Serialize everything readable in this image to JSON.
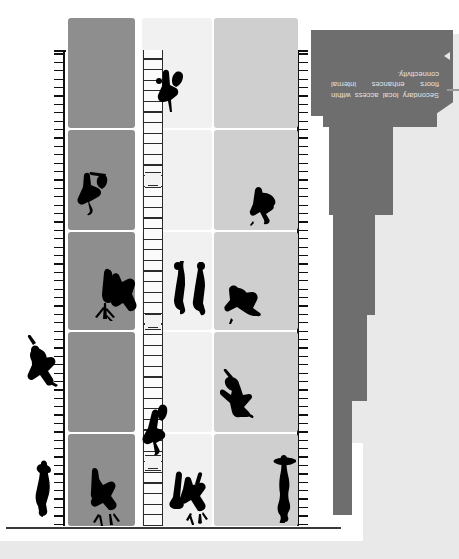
{
  "drawing": {
    "type": "architectural-floor-plan",
    "orientation_deg": 180,
    "canvas": {
      "width": 459,
      "height": 559
    }
  },
  "annotation": {
    "marker_icon": "triangle-marker-icon",
    "text": "Secondary local access within floors enhances internal connectivity.",
    "plate_color": "#6e6e6e",
    "text_color": "#e6e6e6"
  },
  "palette": {
    "background": "#ffffff",
    "background_band": "#e9e9e9",
    "mass_dark": "#6e6e6e",
    "zone_a": "#cfcfcf",
    "zone_b": "#f1f1f1",
    "zone_c": "#8e8e8e",
    "line": "#111111",
    "figure": "#000000",
    "datum": "#3a3a3a"
  },
  "plan": {
    "columns": [
      {
        "name": "zone-a",
        "label": "west bay",
        "fill": "#cfcfcf",
        "x": 0,
        "width": 84
      },
      {
        "name": "zone-b",
        "label": "center bay",
        "fill": "#f1f1f1",
        "x": 86,
        "width": 70
      },
      {
        "name": "zone-c",
        "label": "east bay",
        "fill": "#8e8e8e",
        "x": 163,
        "width": 67
      }
    ],
    "rows": [
      {
        "name": "row-1",
        "y": 2,
        "height": 92
      },
      {
        "name": "row-2",
        "y": 96,
        "height": 100
      },
      {
        "name": "row-3",
        "y": 198,
        "height": 98
      },
      {
        "name": "row-4",
        "y": 298,
        "height": 100
      },
      {
        "name": "row-5",
        "y": 400,
        "height": 110
      }
    ]
  },
  "circulation": {
    "stair": {
      "name": "central-stair",
      "tread_count": 44,
      "landings": [
        55,
        196,
        338
      ]
    }
  },
  "walls": [
    {
      "name": "west-hatched-wall",
      "side": "west"
    },
    {
      "name": "east-hatched-wall",
      "side": "east"
    }
  ],
  "figures": [
    {
      "id": "f1",
      "zone": "zone-a",
      "kind": "standing-figure"
    },
    {
      "id": "f2",
      "zone": "zone-a",
      "kind": "seated-figure"
    },
    {
      "id": "f3",
      "zone": "zone-a",
      "kind": "crouching-figure"
    },
    {
      "id": "f4",
      "zone": "zone-a",
      "kind": "standing-figure"
    },
    {
      "id": "f5",
      "zone": "zone-b",
      "kind": "group-figures"
    },
    {
      "id": "f6",
      "zone": "zone-b",
      "kind": "pair-standing-figures"
    },
    {
      "id": "f7",
      "zone": "zone-b",
      "kind": "walking-figure"
    },
    {
      "id": "f8",
      "zone": "zone-b",
      "kind": "figure-on-stair"
    },
    {
      "id": "f9",
      "zone": "zone-c",
      "kind": "planted-figure"
    },
    {
      "id": "f10",
      "zone": "zone-c",
      "kind": "figure-with-tree"
    },
    {
      "id": "f11",
      "zone": "zone-c",
      "kind": "seated-figure"
    },
    {
      "id": "f12",
      "zone": "east",
      "kind": "standing-figure"
    },
    {
      "id": "f13",
      "zone": "east",
      "kind": "leaning-figure"
    }
  ]
}
